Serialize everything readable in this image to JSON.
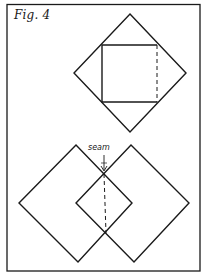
{
  "figure": {
    "label": "Fig. 4",
    "border_color": "#1a1a1a",
    "background": "#ffffff"
  },
  "top_diagram": {
    "description": "Square placed diagonally inside a larger diamond; dashed right edge of square",
    "outer_diamond": {
      "top": [
        130,
        14
      ],
      "right": [
        186,
        73
      ],
      "bottom": [
        130,
        132
      ],
      "left": [
        74,
        73
      ]
    },
    "inner_square": {
      "top_left": [
        102,
        45
      ],
      "top_right": [
        157,
        45
      ],
      "bottom_right": [
        157,
        102
      ],
      "bottom_left": [
        102,
        102
      ]
    },
    "dashed_edge": "right"
  },
  "bottom_diagram": {
    "description": "Two overlapping diamonds joined at a seam, forming a smaller center diamond",
    "seam_label": "seam",
    "left_diamond": {
      "top": [
        76,
        145
      ],
      "right": [
        132,
        203
      ],
      "bottom": [
        78,
        262
      ],
      "left": [
        19,
        203
      ]
    },
    "right_diamond": {
      "top": [
        131,
        145
      ],
      "right": [
        189,
        203
      ],
      "bottom": [
        134,
        262
      ],
      "left": [
        76,
        203
      ]
    },
    "center_diamond": {
      "top": [
        104,
        174
      ],
      "right": [
        132,
        203
      ],
      "bottom": [
        106,
        233
      ],
      "left": [
        77,
        203
      ]
    },
    "seam_line": {
      "from": [
        104,
        174
      ],
      "to": [
        106,
        233
      ],
      "style": "dashed"
    }
  }
}
